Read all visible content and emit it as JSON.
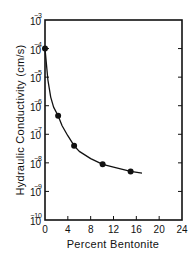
{
  "chart_data": {
    "type": "line",
    "title": "",
    "xlabel": "Percent Bentonite",
    "ylabel": "Hydraulic Conductivity (cm/s)",
    "xlim": [
      0,
      24
    ],
    "ylim_log10": [
      -10,
      -3
    ],
    "y_scale": "log",
    "x_ticks": [
      0,
      4,
      8,
      12,
      16,
      20,
      24
    ],
    "y_tick_exponents": [
      -3,
      -4,
      -5,
      -6,
      -7,
      -8,
      -9,
      -10
    ],
    "y_tick_base": "10",
    "grid": false,
    "legend": null,
    "series": [
      {
        "name": "Measured",
        "marker": "circle",
        "x": [
          0,
          2.3,
          5.1,
          10.1,
          15
        ],
        "log10_y": [
          -4.0,
          -6.35,
          -7.4,
          -8.05,
          -8.3
        ]
      },
      {
        "name": "Fitted curve",
        "marker": "none",
        "x": [
          0,
          0.5,
          1,
          1.5,
          2.3,
          3,
          4,
          5.1,
          6,
          8,
          10.1,
          12,
          15,
          17
        ],
        "log10_y": [
          -4.0,
          -5.1,
          -5.7,
          -6.05,
          -6.35,
          -6.7,
          -7.05,
          -7.4,
          -7.6,
          -7.85,
          -8.05,
          -8.15,
          -8.3,
          -8.36
        ]
      }
    ]
  }
}
